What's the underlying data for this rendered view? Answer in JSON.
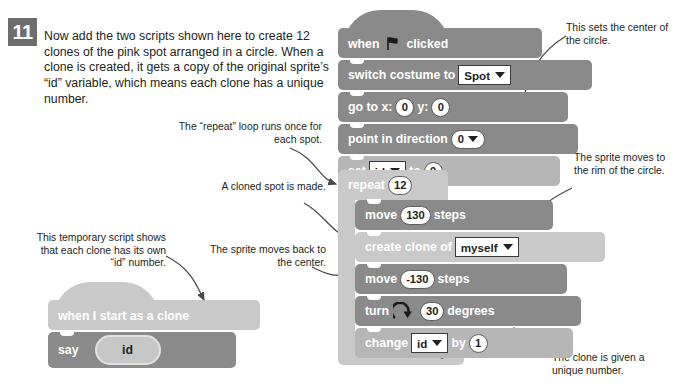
{
  "step": {
    "number": "11"
  },
  "intro": {
    "text": "Now add the two scripts shown here to create 12 clones of the pink spot arranged in a circle. When a clone is created, it gets a copy of the original sprite’s “id” variable, which means each clone has a unique number."
  },
  "notes": {
    "repeat_loop": "The “repeat” loop runs once for each spot.",
    "cloned_spot": "A cloned spot is made.",
    "temp_script": "This temporary script shows that each clone has its own “id” number.",
    "sprite_back": "The sprite moves back to the center.",
    "center": "This sets the center of the circle.",
    "rim": "The sprite moves to the rim of the circle.",
    "unique_number": "The clone is given a unique number."
  },
  "main_script": {
    "hat": {
      "when": "when",
      "icon": "green-flag-icon",
      "clicked": "clicked"
    },
    "switch_costume": {
      "label": "switch costume to",
      "value": "Spot"
    },
    "go_to": {
      "label": "go to x:",
      "x": "0",
      "y_label": "y:",
      "y": "0"
    },
    "point_in_direction": {
      "label": "point in direction",
      "value": "0"
    },
    "set_var": {
      "label": "set",
      "variable": "id",
      "to_label": "to",
      "value": "0"
    },
    "repeat": {
      "label": "repeat",
      "times": "12"
    },
    "move_out": {
      "label": "move",
      "value": "130",
      "units": "steps"
    },
    "create_clone": {
      "label": "create clone of",
      "target": "myself"
    },
    "move_back": {
      "label": "move",
      "value": "-130",
      "units": "steps"
    },
    "turn": {
      "label": "turn",
      "icon": "turn-right-icon",
      "value": "30",
      "units": "degrees"
    },
    "change_var": {
      "label": "change",
      "variable": "id",
      "by_label": "by",
      "value": "1"
    }
  },
  "clone_script": {
    "hat": {
      "label": "when I start as a clone"
    },
    "say": {
      "label": "say",
      "value": "id"
    }
  },
  "colors": {
    "block_dark": "#8a8a8a",
    "block_light": "#b6b6b6",
    "block_lightest": "#c9c9c9",
    "badge": "#6e6e6e",
    "text": "#231f20",
    "page_bg": "#ffffff"
  }
}
